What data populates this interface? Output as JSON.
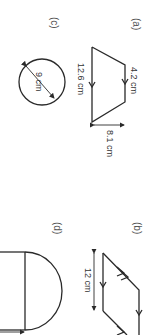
{
  "figures": {
    "a": {
      "label": "(a)",
      "shape": "trapezium",
      "top_side": "4.2 cm",
      "bottom_side": "12.6 cm",
      "height": "8.1 cm"
    },
    "b": {
      "label": "(b)",
      "shape": "parallelogram",
      "side": "12 cm"
    },
    "c": {
      "label": "(c)",
      "shape": "circle",
      "diameter": "9 cm"
    },
    "d": {
      "label": "(d)",
      "shape": "rectangle-with-semicircle"
    }
  },
  "colors": {
    "line": "#2a2a2a",
    "text": "#333333",
    "background": "#ffffff"
  }
}
